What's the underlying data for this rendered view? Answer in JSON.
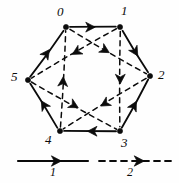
{
  "figure": {
    "type": "directed-multigraph",
    "ink_color": "#0b0b0b",
    "background_color": "#fefefe"
  },
  "vertices": [
    {
      "id": "0",
      "label": "0",
      "x": 66,
      "y": 27,
      "label_x": 57,
      "label_y": 5
    },
    {
      "id": "1",
      "label": "1",
      "x": 120,
      "y": 27,
      "label_x": 121,
      "label_y": 4
    },
    {
      "id": "2",
      "label": "2",
      "x": 150,
      "y": 76,
      "label_x": 158,
      "label_y": 68
    },
    {
      "id": "3",
      "label": "3",
      "x": 120,
      "y": 131,
      "label_x": 121,
      "label_y": 136
    },
    {
      "id": "4",
      "label": "4",
      "x": 60,
      "y": 131,
      "label_x": 45,
      "label_y": 133
    },
    {
      "id": "5",
      "label": "5",
      "x": 28,
      "y": 80,
      "label_x": 11,
      "label_y": 70
    }
  ],
  "edges": [
    {
      "from": "0",
      "to": "1",
      "style": "solid",
      "class": "1",
      "arrow_t": 0.55
    },
    {
      "from": "1",
      "to": "2",
      "style": "solid",
      "class": "1",
      "arrow_t": 0.6
    },
    {
      "from": "3",
      "to": "2",
      "style": "solid",
      "class": "1",
      "arrow_t": 0.55
    },
    {
      "from": "3",
      "to": "4",
      "style": "solid",
      "class": "1",
      "arrow_t": 0.55
    },
    {
      "from": "4",
      "to": "5",
      "style": "solid",
      "class": "1",
      "arrow_t": 0.6
    },
    {
      "from": "5",
      "to": "0",
      "style": "solid",
      "class": "1",
      "arrow_t": 0.58
    },
    {
      "from": "4",
      "to": "0",
      "style": "dashed",
      "class": "2",
      "arrow_t": 0.52
    },
    {
      "from": "1",
      "to": "3",
      "style": "dashed",
      "class": "2",
      "arrow_t": 0.55
    },
    {
      "from": "0",
      "to": "2",
      "style": "dashed",
      "class": "2",
      "arrow_t": 0.52
    },
    {
      "from": "1",
      "to": "5",
      "style": "dashed",
      "class": "2",
      "arrow_t": 0.52
    },
    {
      "from": "5",
      "to": "3",
      "style": "dashed",
      "class": "2",
      "arrow_t": 0.55
    },
    {
      "from": "2",
      "to": "4",
      "style": "dashed",
      "class": "2",
      "arrow_t": 0.55
    }
  ],
  "legend": {
    "entries": [
      {
        "key": "1",
        "label": "1",
        "style": "solid",
        "line_x1": 18,
        "line_x2": 88,
        "line_y": 161,
        "label_x": 50,
        "label_y": 166
      },
      {
        "key": "2",
        "label": "2",
        "style": "dashed",
        "line_x1": 99,
        "line_x2": 172,
        "line_y": 161,
        "label_x": 127,
        "label_y": 166
      }
    ]
  }
}
